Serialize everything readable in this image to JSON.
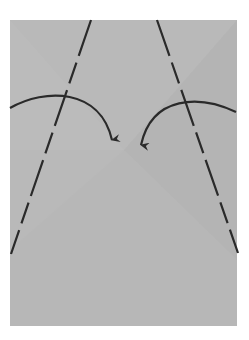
{
  "diagram": {
    "type": "origami-fold-step",
    "paper": {
      "x": 10,
      "y": 20,
      "width": 227,
      "height": 306,
      "color": "#b9b9b9",
      "shade_color": "#b1b1b1",
      "light_color": "#bfbfbf"
    },
    "fold_lines": [
      {
        "name": "left-valley-fold-line",
        "x1": 91,
        "y1": 20,
        "x2": 11,
        "y2": 254,
        "style": "dashed"
      },
      {
        "name": "right-valley-fold-line",
        "x1": 157,
        "y1": 20,
        "x2": 238,
        "y2": 253,
        "style": "dashed"
      }
    ],
    "arrows": [
      {
        "name": "left-fold-arrow",
        "path": "M10 108 C 45 88, 100 88, 112 146",
        "tip": [
          112,
          148
        ],
        "direction": "inward"
      },
      {
        "name": "right-fold-arrow",
        "path": "M236 112 C 200 95, 152 95, 141 151",
        "tip": [
          140,
          153
        ],
        "direction": "inward"
      }
    ],
    "line_color": "#2a2a2a"
  }
}
